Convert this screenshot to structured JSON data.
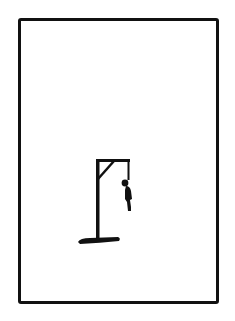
{
  "game": {
    "name": "hangman",
    "stage": "complete-figure-hanging",
    "colors": {
      "background": "#ffffff",
      "ink": "#111111"
    }
  },
  "panel": {
    "border_color": "#111111"
  },
  "gallows": {
    "parts": [
      "base",
      "post",
      "crossbeam",
      "brace",
      "rope"
    ]
  },
  "figure": {
    "parts": [
      "head",
      "body"
    ]
  }
}
